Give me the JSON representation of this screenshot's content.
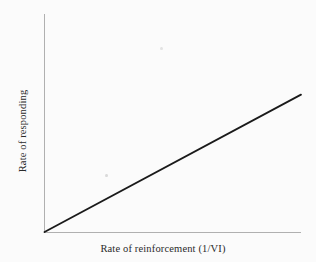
{
  "figure": {
    "background_color": "#fbfbfb",
    "axis_color": "#b0b0b0",
    "series_color": "#1a1a1a",
    "width": 316,
    "height": 262
  },
  "chart_data": {
    "type": "line",
    "title": "",
    "subtitle": "",
    "xlabel": "Rate of reinforcement (1/VI)",
    "ylabel": "Rate of responding",
    "xlim": [
      0,
      1
    ],
    "ylim": [
      0,
      1
    ],
    "grid": false,
    "legend": null,
    "xticks": [],
    "yticks": [],
    "xticklabels": [],
    "yticklabels": [],
    "annotations": [],
    "series": [
      {
        "name": "response rate vs reinforcement rate",
        "style": "solid",
        "color": "#1a1a1a",
        "x": [
          0.0,
          1.0
        ],
        "y": [
          0.0,
          0.63
        ],
        "description": "straight line of constant positive slope rising from the origin"
      }
    ]
  }
}
